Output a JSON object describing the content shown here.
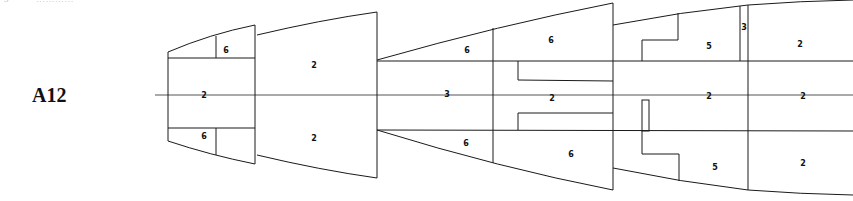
{
  "header": {
    "cut_off_number": "5",
    "cut_off_text": "…………"
  },
  "figure": {
    "label": "A12"
  },
  "sections": [
    {
      "id": "section-1",
      "zones": [
        {
          "position": "top-right",
          "value": "6"
        },
        {
          "position": "center",
          "value": "2"
        },
        {
          "position": "bottom-left",
          "value": "6"
        }
      ]
    },
    {
      "id": "section-2",
      "zones": [
        {
          "position": "top",
          "value": "2"
        },
        {
          "position": "bottom",
          "value": "2"
        }
      ]
    },
    {
      "id": "section-3",
      "zones": [
        {
          "position": "top-left",
          "value": "6"
        },
        {
          "position": "top-right",
          "value": "6"
        },
        {
          "position": "center-left",
          "value": "3"
        },
        {
          "position": "center-right",
          "value": "2"
        },
        {
          "position": "bottom-left",
          "value": "6"
        },
        {
          "position": "bottom-right",
          "value": "6"
        }
      ]
    },
    {
      "id": "section-4",
      "zones": [
        {
          "position": "top",
          "value": "5"
        },
        {
          "position": "top-strip",
          "value": "3"
        },
        {
          "position": "center",
          "value": "2"
        },
        {
          "position": "bottom",
          "value": "5"
        }
      ]
    },
    {
      "id": "section-5",
      "zones": [
        {
          "position": "top",
          "value": "2"
        },
        {
          "position": "center",
          "value": "2"
        },
        {
          "position": "bottom",
          "value": "2"
        }
      ]
    }
  ]
}
